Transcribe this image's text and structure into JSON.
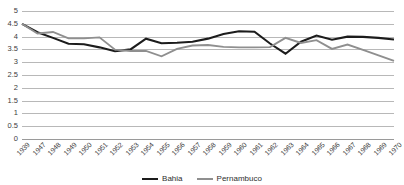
{
  "chart_data": {
    "type": "line",
    "title": "",
    "subtitle": "",
    "xlabel": "",
    "ylabel": "",
    "ylim": [
      0,
      5
    ],
    "yticks": [
      "0",
      "0.5",
      "1",
      "1.5",
      "2",
      "2.5",
      "3",
      "3.5",
      "4",
      "4.5",
      "5"
    ],
    "ytick_values": [
      0,
      0.5,
      1,
      1.5,
      2,
      2.5,
      3,
      3.5,
      4,
      4.5,
      5
    ],
    "grid": "horizontal",
    "legend_position": "bottom-center",
    "categories": [
      "1939",
      "1947",
      "1948",
      "1949",
      "1950",
      "1951",
      "1952",
      "1953",
      "1954",
      "1955",
      "1956",
      "1957",
      "1958",
      "1959",
      "1960",
      "1961",
      "1962",
      "1963",
      "1964",
      "1965",
      "1966",
      "1967",
      "1968",
      "1969",
      "1970"
    ],
    "series": [
      {
        "name": "Bahia",
        "color": "#1c1c1c",
        "width": 2.1,
        "values": [
          4.5,
          4.17,
          3.95,
          3.72,
          3.7,
          3.58,
          3.43,
          3.5,
          3.92,
          3.74,
          3.76,
          3.8,
          3.92,
          4.1,
          4.21,
          4.19,
          3.73,
          3.33,
          3.8,
          4.04,
          3.88,
          4.0,
          3.99,
          3.95,
          3.89
        ]
      },
      {
        "name": "Pernambuco",
        "color": "#8f8f8f",
        "width": 1.9,
        "values": [
          4.5,
          4.12,
          4.18,
          3.93,
          3.93,
          3.97,
          3.49,
          3.44,
          3.44,
          3.23,
          3.52,
          3.65,
          3.67,
          3.6,
          3.58,
          3.58,
          3.59,
          3.95,
          3.75,
          3.86,
          3.52,
          3.69,
          3.48,
          3.27,
          3.05
        ]
      }
    ]
  },
  "legend": {
    "items": [
      {
        "label": "Bahia"
      },
      {
        "label": "Pernambuco"
      }
    ]
  }
}
